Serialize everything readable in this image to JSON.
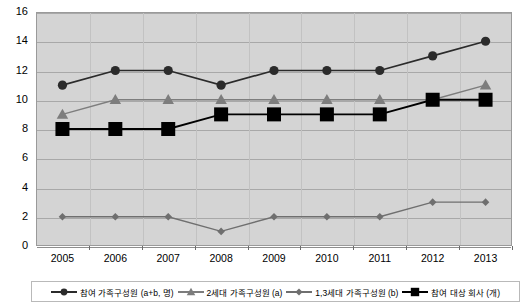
{
  "chart_data": {
    "type": "line",
    "title": "",
    "xlabel": "",
    "ylabel": "",
    "ylim": [
      0,
      16
    ],
    "ytick_step": 2,
    "grid": true,
    "legend_position": "bottom",
    "categories": [
      "2005",
      "2006",
      "2007",
      "2008",
      "2009",
      "2010",
      "2011",
      "2012",
      "2013"
    ],
    "yticks": [
      "0",
      "2",
      "4",
      "6",
      "8",
      "10",
      "12",
      "14",
      "16"
    ],
    "series": [
      {
        "name": "참여 가족구성원 (a+b, 명)",
        "marker": "circle",
        "color": "#2b2b2b",
        "values": [
          11,
          12,
          12,
          11,
          12,
          12,
          12,
          13,
          14
        ]
      },
      {
        "name": "2세대 가족구성원 (a)",
        "marker": "triangle",
        "color": "#7d7d7d",
        "values": [
          9,
          10,
          10,
          10,
          10,
          10,
          10,
          10,
          11
        ]
      },
      {
        "name": "1,3세대 가족구성원 (b)",
        "marker": "diamond",
        "color": "#6f6f6f",
        "values": [
          2,
          2,
          2,
          1,
          2,
          2,
          2,
          3,
          3
        ]
      },
      {
        "name": "참여 대상 회사 (개)",
        "marker": "square",
        "color": "#000000",
        "values": [
          8,
          8,
          8,
          9,
          9,
          9,
          9,
          10,
          10
        ]
      }
    ]
  },
  "style": {
    "plot_background": "#d4d4d4",
    "gridline_color": "#a8a8a8",
    "page_background": "#ffffff"
  }
}
